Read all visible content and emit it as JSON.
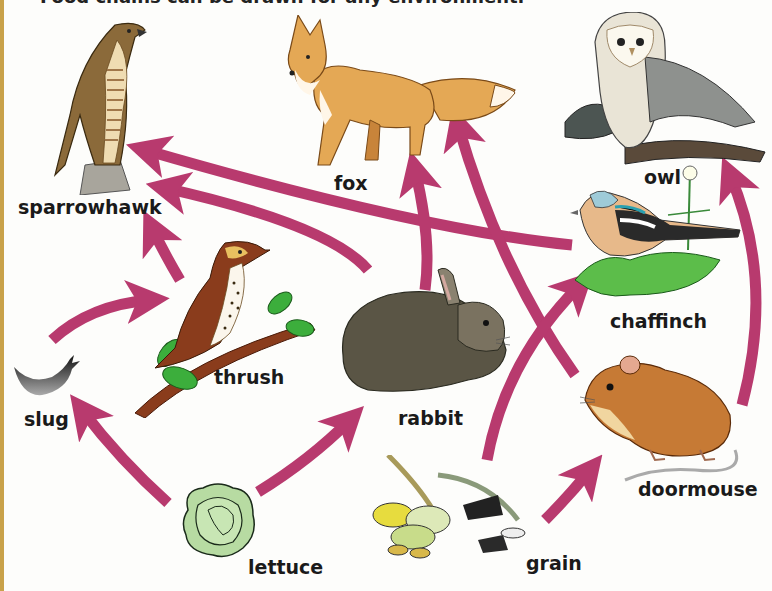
{
  "caption": "Food chains can be drawn for any environment.",
  "arrow_color": "#b83a6e",
  "organisms": {
    "sparrowhawk": {
      "label": "sparrowhawk"
    },
    "fox": {
      "label": "fox"
    },
    "owl": {
      "label": "owl"
    },
    "thrush": {
      "label": "thrush"
    },
    "chaffinch": {
      "label": "chaffinch"
    },
    "slug": {
      "label": "slug"
    },
    "rabbit": {
      "label": "rabbit"
    },
    "doormouse": {
      "label": "doormouse"
    },
    "lettuce": {
      "label": "lettuce"
    },
    "grain": {
      "label": "grain"
    }
  },
  "links": [
    {
      "from": "lettuce",
      "to": "slug"
    },
    {
      "from": "lettuce",
      "to": "rabbit"
    },
    {
      "from": "slug",
      "to": "thrush"
    },
    {
      "from": "thrush",
      "to": "sparrowhawk"
    },
    {
      "from": "rabbit",
      "to": "sparrowhawk"
    },
    {
      "from": "chaffinch",
      "to": "sparrowhawk"
    },
    {
      "from": "rabbit",
      "to": "fox"
    },
    {
      "from": "doormouse",
      "to": "fox"
    },
    {
      "from": "grain",
      "to": "chaffinch"
    },
    {
      "from": "grain",
      "to": "doormouse"
    },
    {
      "from": "doormouse",
      "to": "owl"
    }
  ]
}
